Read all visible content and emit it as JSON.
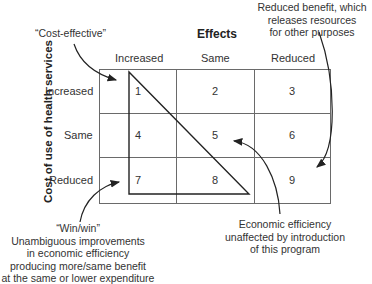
{
  "title": "Effects",
  "y_axis_label": "Cost of use of health services",
  "columns": [
    "Increased",
    "Same",
    "Reduced"
  ],
  "rows": [
    "Increased",
    "Same",
    "Reduced"
  ],
  "cells": [
    "1",
    "2",
    "3",
    "4",
    "5",
    "6",
    "7",
    "8",
    "9"
  ],
  "annotations": {
    "cost_effective": "“Cost-effective”",
    "reduced_benefit": [
      "Reduced benefit, which",
      "releases resources",
      "for other purposes"
    ],
    "win_win": [
      "“Win/win”",
      "Unambiguous improvements",
      "in economic efficiency",
      "producing more/same benefit",
      "at the same or lower expenditure"
    ],
    "unaffected": [
      "Economic efficiency",
      "unaffected by introduction",
      "of this program"
    ]
  },
  "colors": {
    "line": "#555555",
    "triangle": "#222222",
    "text": "#333333"
  }
}
